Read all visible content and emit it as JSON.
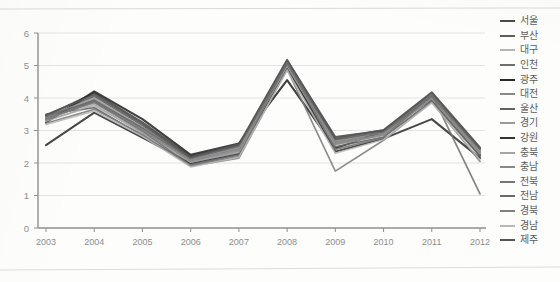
{
  "chart_data": {
    "type": "line",
    "title": "",
    "subtitle": "",
    "xlabel": "",
    "ylabel": "",
    "x": [
      2003,
      2004,
      2005,
      2006,
      2007,
      2008,
      2009,
      2010,
      2011,
      2012
    ],
    "categories": [
      "2003",
      "2004",
      "2005",
      "2006",
      "2007",
      "2008",
      "2009",
      "2010",
      "2011",
      "2012"
    ],
    "xtick_labels": [
      "2003",
      "2004",
      "2005",
      "2006",
      "2007",
      "2008",
      "2009",
      "2010",
      "2011",
      "2012"
    ],
    "ytick_labels": [
      "0",
      "1",
      "2",
      "3",
      "4",
      "5",
      "6"
    ],
    "yticks": [
      0,
      1,
      2,
      3,
      4,
      5,
      6
    ],
    "ylim": [
      0,
      6
    ],
    "grid": "horizontal",
    "legend_position": "right",
    "series": [
      {
        "name": "서울",
        "color": "#4a4a4a",
        "width": 2.0,
        "values": [
          3.45,
          4.15,
          3.25,
          2.2,
          2.55,
          5.15,
          2.8,
          3.0,
          4.15,
          2.45
        ]
      },
      {
        "name": "부산",
        "color": "#5e5e5e",
        "width": 1.7,
        "values": [
          3.4,
          4.05,
          3.15,
          2.15,
          2.5,
          5.1,
          2.7,
          2.95,
          4.1,
          2.4
        ]
      },
      {
        "name": "대구",
        "color": "#b4b4b4",
        "width": 1.5,
        "values": [
          3.3,
          3.75,
          2.95,
          2.05,
          2.35,
          4.95,
          2.6,
          2.9,
          4.0,
          2.3
        ]
      },
      {
        "name": "인천",
        "color": "#6f6f6f",
        "width": 1.7,
        "values": [
          3.35,
          3.95,
          3.05,
          2.1,
          2.45,
          5.05,
          2.65,
          2.92,
          4.05,
          2.35
        ]
      },
      {
        "name": "광주",
        "color": "#2b2b2b",
        "width": 2.1,
        "values": [
          3.25,
          4.2,
          3.35,
          2.25,
          2.6,
          4.55,
          2.45,
          2.98,
          3.95,
          2.25
        ]
      },
      {
        "name": "대전",
        "color": "#8a8a8a",
        "width": 1.6,
        "values": [
          3.38,
          3.85,
          3.0,
          2.08,
          2.42,
          5.0,
          2.62,
          2.88,
          4.02,
          2.32
        ]
      },
      {
        "name": "울산",
        "color": "#636363",
        "width": 1.7,
        "values": [
          3.5,
          3.7,
          2.85,
          1.95,
          2.25,
          4.9,
          2.5,
          2.8,
          3.9,
          2.2
        ]
      },
      {
        "name": "경기",
        "color": "#9a9a9a",
        "width": 1.5,
        "values": [
          3.42,
          4.0,
          3.1,
          2.12,
          2.48,
          5.08,
          2.68,
          2.94,
          4.08,
          2.38
        ]
      },
      {
        "name": "강원",
        "color": "#333333",
        "width": 2.0,
        "values": [
          2.55,
          3.55,
          2.78,
          2.0,
          2.3,
          4.92,
          2.35,
          2.75,
          3.35,
          2.15
        ]
      },
      {
        "name": "충북",
        "color": "#a5a5a5",
        "width": 1.5,
        "values": [
          3.28,
          3.8,
          2.92,
          2.02,
          2.32,
          4.98,
          2.55,
          2.85,
          3.98,
          2.28
        ]
      },
      {
        "name": "충남",
        "color": "#898989",
        "width": 1.6,
        "values": [
          3.32,
          3.9,
          3.02,
          2.06,
          2.38,
          5.02,
          2.58,
          2.86,
          4.0,
          2.3
        ]
      },
      {
        "name": "전북",
        "color": "#777777",
        "width": 1.7,
        "values": [
          3.36,
          3.88,
          2.98,
          1.92,
          2.2,
          5.12,
          2.42,
          2.78,
          4.12,
          1.05
        ]
      },
      {
        "name": "전남",
        "color": "#6a6a6a",
        "width": 1.7,
        "values": [
          3.44,
          3.92,
          3.08,
          2.14,
          2.52,
          5.06,
          2.72,
          2.96,
          4.06,
          2.42
        ]
      },
      {
        "name": "경북",
        "color": "#808080",
        "width": 1.6,
        "values": [
          3.22,
          3.65,
          2.88,
          1.9,
          2.15,
          4.88,
          1.75,
          2.7,
          3.88,
          2.05
        ]
      },
      {
        "name": "경남",
        "color": "#b8b8b8",
        "width": 1.5,
        "values": [
          3.18,
          3.6,
          2.82,
          1.88,
          2.18,
          4.85,
          2.3,
          2.72,
          3.85,
          2.1
        ]
      },
      {
        "name": "제주",
        "color": "#555555",
        "width": 1.8,
        "values": [
          3.48,
          4.1,
          3.2,
          2.18,
          2.58,
          5.18,
          2.75,
          3.02,
          4.18,
          2.48
        ]
      }
    ]
  },
  "legend": {
    "items": [
      {
        "label": "서울"
      },
      {
        "label": "부산"
      },
      {
        "label": "대구"
      },
      {
        "label": "인천"
      },
      {
        "label": "광주"
      },
      {
        "label": "대전"
      },
      {
        "label": "울산"
      },
      {
        "label": "경기"
      },
      {
        "label": "강원"
      },
      {
        "label": "충북"
      },
      {
        "label": "충남"
      },
      {
        "label": "전북"
      },
      {
        "label": "전남"
      },
      {
        "label": "경북"
      },
      {
        "label": "경남"
      },
      {
        "label": "제주"
      }
    ]
  },
  "colors": {
    "axis": "#8f8f8f",
    "grid": "#e2e2e2",
    "tick_text": "#8d8d8d",
    "legend_text": "#5c5c5c",
    "page": "#fdfdfc"
  }
}
